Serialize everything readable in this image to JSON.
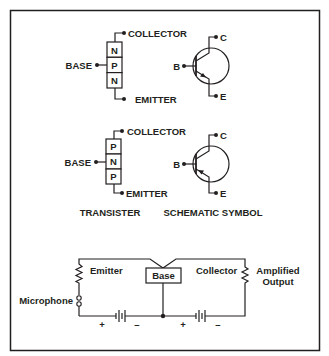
{
  "figure": {
    "frame": {
      "x": 10,
      "y": 10,
      "width": 309,
      "height": 340,
      "stroke": "#231f20"
    },
    "npn": {
      "transistor": {
        "regions": [
          "N",
          "P",
          "N"
        ],
        "base_label": "BASE",
        "collector_label": "COLLECTOR",
        "emitter_label": "EMITTER"
      },
      "symbol": {
        "base_label": "B",
        "collector_label": "C",
        "emitter_label": "E",
        "arrow": "outward"
      }
    },
    "pnp": {
      "transistor": {
        "regions": [
          "P",
          "N",
          "P"
        ],
        "base_label": "BASE",
        "collector_label": "COLLECTOR",
        "emitter_label": "EMITTER"
      },
      "symbol": {
        "base_label": "B",
        "collector_label": "C",
        "emitter_label": "E",
        "arrow": "inward"
      }
    },
    "captions": {
      "transistor": "TRANSISTER",
      "schematic": "SCHEMATIC SYMBOL"
    },
    "circuit": {
      "emitter_label": "Emitter",
      "base_label": "Base",
      "collector_label": "Collector",
      "input_label": "Microphone",
      "output_label_line1": "Amplified",
      "output_label_line2": "Output",
      "battery_left": {
        "plus": "+",
        "minus": "–"
      },
      "battery_right": {
        "plus": "+",
        "minus": "–"
      }
    }
  }
}
